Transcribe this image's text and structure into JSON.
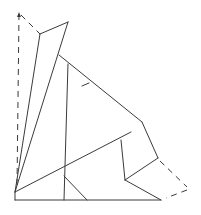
{
  "diagram": {
    "colors": {
      "stroke": "#3a3a3a",
      "background": "#ffffff"
    },
    "solid_lines": [
      {
        "name": "left-long-line-a",
        "from": [
          40,
          34
        ],
        "to": [
          15,
          192
        ]
      },
      {
        "name": "left-long-line-b",
        "from": [
          68,
          22
        ],
        "to": [
          15,
          192
        ]
      },
      {
        "name": "top-cap-line",
        "from": [
          40,
          34
        ],
        "to": [
          68,
          22
        ]
      },
      {
        "name": "upper-diagonal",
        "from": [
          59,
          55
        ],
        "to": [
          142,
          122
        ]
      },
      {
        "name": "vertical-line",
        "from": [
          68,
          64
        ],
        "to": [
          64,
          200
        ]
      },
      {
        "name": "long-diagonal",
        "from": [
          15,
          192
        ],
        "to": [
          131,
          132
        ]
      },
      {
        "name": "square-left-edge",
        "from": [
          121,
          140
        ],
        "to": [
          125,
          180
        ]
      },
      {
        "name": "square-right-edge",
        "from": [
          142,
          122
        ],
        "to": [
          158,
          158
        ]
      },
      {
        "name": "square-bottom-edge",
        "from": [
          158,
          158
        ],
        "to": [
          125,
          180
        ]
      },
      {
        "name": "lower-right-edge",
        "from": [
          125,
          180
        ],
        "to": [
          161,
          200
        ]
      },
      {
        "name": "baseline",
        "from": [
          15,
          200
        ],
        "to": [
          161,
          200
        ]
      },
      {
        "name": "left-base-edge",
        "from": [
          15,
          192
        ],
        "to": [
          15,
          200
        ]
      },
      {
        "name": "short-diagonal",
        "from": [
          64,
          176
        ],
        "to": [
          87,
          200
        ]
      },
      {
        "name": "tick-mark",
        "from": [
          82,
          86
        ],
        "to": [
          89,
          83
        ]
      }
    ],
    "dashed_lines": [
      {
        "name": "left-dashed-vertical",
        "from": [
          19,
          14
        ],
        "to": [
          17,
          186
        ]
      },
      {
        "name": "top-dashed-diagonal",
        "from": [
          21,
          15
        ],
        "to": [
          40,
          34
        ]
      },
      {
        "name": "right-dashed-outer",
        "from": [
          160,
          161
        ],
        "to": [
          187,
          187
        ]
      },
      {
        "name": "right-dashed-return",
        "from": [
          187,
          190
        ],
        "to": [
          166,
          198
        ]
      }
    ]
  }
}
